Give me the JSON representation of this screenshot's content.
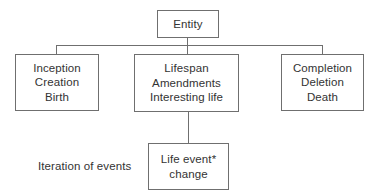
{
  "diagram": {
    "colors": {
      "background": "#ffffff",
      "box_border": "#6f6f6f",
      "connector": "#6f6f6f",
      "text": "#333333"
    },
    "nodes": {
      "entity": {
        "id": "entity",
        "lines": [
          "Entity"
        ]
      },
      "start_phase": {
        "id": "start-phase",
        "lines": [
          "Inception",
          "Creation",
          "Birth"
        ]
      },
      "middle_phase": {
        "id": "middle-phase",
        "lines": [
          "Lifespan",
          "Amendments",
          "Interesting life"
        ]
      },
      "end_phase": {
        "id": "end-phase",
        "lines": [
          "Completion",
          "Deletion",
          "Death"
        ]
      },
      "life_event": {
        "id": "life-event",
        "lines": [
          "Life event*",
          "change"
        ]
      }
    },
    "annotations": {
      "iteration_label": "Iteration of events"
    },
    "connectors": [
      {
        "id": "entity-to-bus",
        "from": "entity",
        "to": "bus",
        "orientation": "vertical"
      },
      {
        "id": "bus",
        "from": "start-phase",
        "to": "end-phase",
        "orientation": "horizontal"
      },
      {
        "id": "bus-to-start",
        "from": "bus",
        "to": "start-phase",
        "orientation": "vertical"
      },
      {
        "id": "bus-to-middle",
        "from": "bus",
        "to": "middle-phase",
        "orientation": "vertical"
      },
      {
        "id": "bus-to-end",
        "from": "bus",
        "to": "end-phase",
        "orientation": "vertical"
      },
      {
        "id": "middle-to-life-event",
        "from": "middle-phase",
        "to": "life-event",
        "orientation": "vertical"
      }
    ]
  }
}
